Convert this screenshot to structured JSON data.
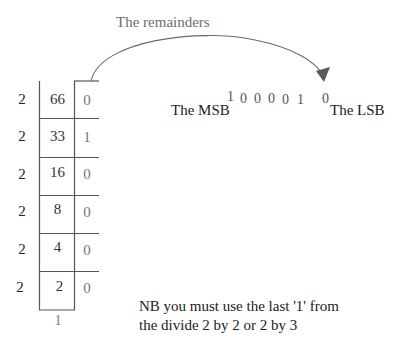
{
  "diagram": {
    "title": "The remainders",
    "divisor": "2",
    "rows": [
      {
        "divisor": "2",
        "quotient": "66",
        "remainder": "0"
      },
      {
        "divisor": "2",
        "quotient": "33",
        "remainder": "1"
      },
      {
        "divisor": "2",
        "quotient": "16",
        "remainder": "0"
      },
      {
        "divisor": "2",
        "quotient": "8",
        "remainder": "0"
      },
      {
        "divisor": "2",
        "quotient": "4",
        "remainder": "0"
      },
      {
        "divisor": "2",
        "quotient": "2",
        "remainder": "0"
      }
    ],
    "final_quotient": "1",
    "binary_digits": [
      "1",
      "0",
      "0",
      "0",
      "0",
      "1",
      "0"
    ],
    "msb_label": "The MSB",
    "lsb_label": "The LSB",
    "note_lines": [
      "NB you must use the last '1' from",
      "the divide 2 by 2 or 2 by 3"
    ],
    "colors": {
      "lines": "#555555",
      "arrow": "#5a5a5a",
      "title": "#6e6e6e"
    }
  }
}
